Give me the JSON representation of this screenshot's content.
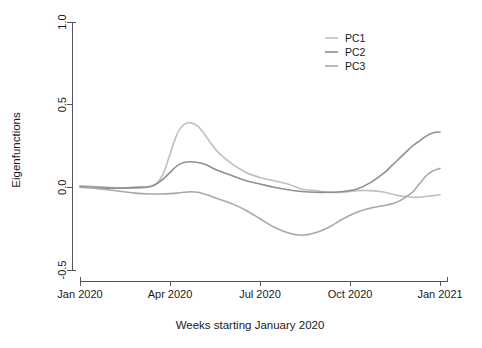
{
  "chart_data": {
    "type": "line",
    "title": "",
    "xlabel": "Weeks starting January 2020",
    "ylabel": "Eigenfunctions",
    "xlim": [
      0,
      53
    ],
    "ylim": [
      -0.5,
      1.0
    ],
    "grid": false,
    "legend_position": "top-right",
    "xticks": [
      {
        "value": 0,
        "label": "Jan 2020"
      },
      {
        "value": 13,
        "label": "Apr 2020"
      },
      {
        "value": 26,
        "label": "Jul 2020"
      },
      {
        "value": 39,
        "label": "Oct 2020"
      },
      {
        "value": 52,
        "label": "Jan 2021"
      }
    ],
    "yticks": [
      {
        "value": 1.0,
        "label": "1.0"
      },
      {
        "value": 0.5,
        "label": "0.5"
      },
      {
        "value": 0.0,
        "label": "0.0"
      },
      {
        "value": -0.5,
        "label": "-0.5"
      }
    ],
    "x": [
      0,
      2,
      4,
      6,
      8,
      10,
      11,
      12,
      13,
      14,
      15,
      16,
      17,
      18,
      19,
      20,
      22,
      24,
      26,
      28,
      30,
      32,
      34,
      36,
      38,
      40,
      42,
      44,
      45,
      46,
      47,
      48,
      49,
      50,
      51,
      52
    ],
    "series": [
      {
        "name": "PC1",
        "color": "#bfbfbf",
        "values": [
          0.01,
          0.005,
          0.0,
          -0.005,
          -0.005,
          0.0,
          0.02,
          0.08,
          0.2,
          0.32,
          0.38,
          0.39,
          0.37,
          0.32,
          0.26,
          0.21,
          0.14,
          0.09,
          0.06,
          0.04,
          0.02,
          -0.01,
          -0.02,
          -0.03,
          -0.03,
          -0.02,
          -0.02,
          -0.03,
          -0.04,
          -0.05,
          -0.055,
          -0.06,
          -0.06,
          -0.055,
          -0.05,
          -0.045
        ]
      },
      {
        "name": "PC2",
        "color": "#8f8f8f",
        "values": [
          0.005,
          0.0,
          -0.005,
          -0.005,
          0.0,
          0.005,
          0.02,
          0.05,
          0.09,
          0.13,
          0.15,
          0.155,
          0.15,
          0.14,
          0.12,
          0.1,
          0.07,
          0.04,
          0.02,
          0.0,
          -0.015,
          -0.025,
          -0.03,
          -0.03,
          -0.025,
          -0.01,
          0.03,
          0.09,
          0.13,
          0.17,
          0.21,
          0.25,
          0.28,
          0.31,
          0.33,
          0.335
        ]
      },
      {
        "name": "PC3",
        "color": "#a8a8a8",
        "values": [
          0.0,
          -0.005,
          -0.015,
          -0.025,
          -0.035,
          -0.04,
          -0.04,
          -0.04,
          -0.038,
          -0.035,
          -0.03,
          -0.027,
          -0.03,
          -0.04,
          -0.055,
          -0.07,
          -0.1,
          -0.14,
          -0.19,
          -0.24,
          -0.275,
          -0.29,
          -0.275,
          -0.24,
          -0.19,
          -0.15,
          -0.125,
          -0.11,
          -0.1,
          -0.085,
          -0.06,
          -0.03,
          0.02,
          0.07,
          0.1,
          0.115
        ]
      }
    ],
    "legend": [
      {
        "label": "PC1",
        "color": "#bfbfbf"
      },
      {
        "label": "PC2",
        "color": "#8f8f8f"
      },
      {
        "label": "PC3",
        "color": "#a8a8a8"
      }
    ]
  }
}
